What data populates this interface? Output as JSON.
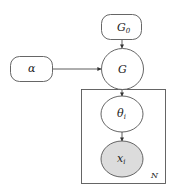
{
  "diagram": {
    "type": "plate-notation",
    "nodes": {
      "g0": {
        "label": "G",
        "subscript": "0",
        "shape": "rounded-rect",
        "observed": false
      },
      "alpha": {
        "label": "α",
        "shape": "rounded-rect",
        "observed": false
      },
      "g": {
        "label": "G",
        "shape": "ellipse",
        "observed": false
      },
      "theta": {
        "label": "θ",
        "subscript": "i",
        "shape": "ellipse",
        "observed": false
      },
      "x": {
        "label": "x",
        "subscript": "i",
        "shape": "ellipse",
        "observed": true
      }
    },
    "edges": [
      {
        "from": "g0",
        "to": "g"
      },
      {
        "from": "alpha",
        "to": "g"
      },
      {
        "from": "g",
        "to": "theta"
      },
      {
        "from": "theta",
        "to": "x"
      }
    ],
    "plate": {
      "label": "N",
      "contains": [
        "theta",
        "x"
      ]
    },
    "colors": {
      "stroke": "#444444",
      "observed_fill": "#dcdcdc",
      "background": "#ffffff"
    }
  }
}
